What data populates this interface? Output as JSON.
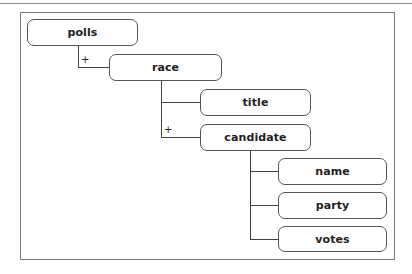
{
  "diagram": {
    "type": "xml-schema-tree",
    "nodes": [
      {
        "id": "polls",
        "label": "polls",
        "parent": null
      },
      {
        "id": "race",
        "label": "race",
        "parent": "polls",
        "multiplicity": "+"
      },
      {
        "id": "title",
        "label": "title",
        "parent": "race"
      },
      {
        "id": "candidate",
        "label": "candidate",
        "parent": "race",
        "multiplicity": "+"
      },
      {
        "id": "name",
        "label": "name",
        "parent": "candidate"
      },
      {
        "id": "party",
        "label": "party",
        "parent": "candidate"
      },
      {
        "id": "votes",
        "label": "votes",
        "parent": "candidate"
      }
    ],
    "labels": {
      "polls": "polls",
      "race": "race",
      "title": "title",
      "candidate": "candidate",
      "name": "name",
      "party": "party",
      "votes": "votes"
    },
    "multiplicity": {
      "race": "+",
      "candidate": "+"
    }
  }
}
